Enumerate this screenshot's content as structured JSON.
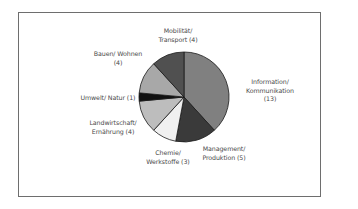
{
  "chart_data": {
    "type": "pie",
    "title": "",
    "total": 34,
    "start_angle_deg": 0,
    "direction": "clockwise",
    "slices": [
      {
        "label": "Information/ Kommunikation",
        "value": 13,
        "color": "#808080"
      },
      {
        "label": "Management/ Produktion",
        "value": 5,
        "color": "#3a3a3a"
      },
      {
        "label": "Chemie/ Werkstoffe",
        "value": 3,
        "color": "#f0f0f0"
      },
      {
        "label": "Landwirtschaft/ Ernährung",
        "value": 4,
        "color": "#bdbdbd"
      },
      {
        "label": "Umwelt/ Natur",
        "value": 1,
        "color": "#111111"
      },
      {
        "label": "Bauen/ Wohnen",
        "value": 4,
        "color": "#a8a8a8"
      },
      {
        "label": "Mobilität/ Transport",
        "value": 4,
        "color": "#505050"
      }
    ],
    "legend": "none (direct labels)"
  },
  "labels": {
    "information": {
      "line1": "Information/",
      "line2": "Kommunikation",
      "line3": "(13)"
    },
    "management": {
      "line1": "Management/",
      "line2": "Produktion (5)"
    },
    "chemie": {
      "line1": "Chemie/",
      "line2": "Werkstoffe (3)"
    },
    "landwirtschaft": {
      "line1": "Landwirtschaft/",
      "line2": "Ernährung (4)"
    },
    "umwelt": {
      "line1": "Umwelt/ Natur (1)"
    },
    "bauen": {
      "line1": "Bauen/ Wohnen",
      "line2": "(4)"
    },
    "mobilitaet": {
      "line1": "Mobilität/",
      "line2": "Transport (4)"
    }
  }
}
